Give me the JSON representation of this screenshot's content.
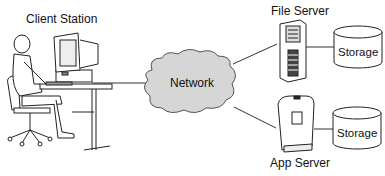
{
  "diagram": {
    "title": "",
    "nodes": [
      {
        "id": "client",
        "label": "Client Station",
        "icon": "client-workstation-icon"
      },
      {
        "id": "network",
        "label": "Network",
        "icon": "cloud-icon"
      },
      {
        "id": "file_server",
        "label": "File Server",
        "icon": "tower-server-icon"
      },
      {
        "id": "app_server",
        "label": "App Server",
        "icon": "app-server-icon"
      },
      {
        "id": "storage1",
        "label": "Storage",
        "icon": "database-cylinder-icon"
      },
      {
        "id": "storage2",
        "label": "Storage",
        "icon": "database-cylinder-icon"
      }
    ],
    "edges": [
      {
        "from": "client",
        "to": "network"
      },
      {
        "from": "network",
        "to": "file_server"
      },
      {
        "from": "network",
        "to": "app_server"
      },
      {
        "from": "file_server",
        "to": "storage1"
      },
      {
        "from": "app_server",
        "to": "storage2"
      }
    ],
    "colors": {
      "line": "#333333",
      "cloud_fill": "#d6d6d6",
      "stroke": "#222222",
      "background": "#ffffff"
    }
  }
}
